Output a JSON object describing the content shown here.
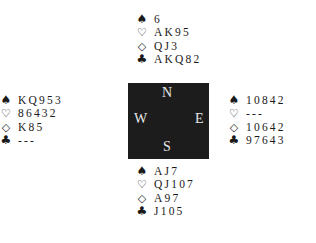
{
  "suit_symbols": {
    "spades": "♠",
    "hearts": "♡",
    "diamonds": "◇",
    "clubs": "♣"
  },
  "compass": {
    "north": "N",
    "south": "S",
    "east": "E",
    "west": "W"
  },
  "hands": {
    "north": {
      "spades": "6",
      "hearts": "AK95",
      "diamonds": "QJ3",
      "clubs": "AKQ82"
    },
    "west": {
      "spades": "KQ953",
      "hearts": "86432",
      "diamonds": "K85",
      "clubs": "---"
    },
    "east": {
      "spades": "10842",
      "hearts": "---",
      "diamonds": "10642",
      "clubs": "97643"
    },
    "south": {
      "spades": "AJ7",
      "hearts": "QJ107",
      "diamonds": "A97",
      "clubs": "J105"
    }
  },
  "colors": {
    "compass_background": "#1c1c1c",
    "compass_text": "#e8e8e8",
    "text": "#1a1a1a",
    "background": "#ffffff"
  }
}
